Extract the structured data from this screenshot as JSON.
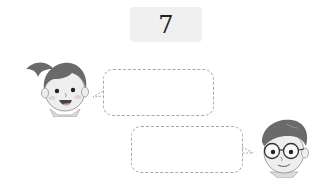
{
  "problem": {
    "number": "7"
  },
  "characters": [
    {
      "name": "girl",
      "icon": "girl-face-icon",
      "position": "left"
    },
    {
      "name": "boy",
      "icon": "boy-with-glasses-icon",
      "position": "right"
    }
  ],
  "speech_bubbles": [
    {
      "speaker": "girl",
      "text": ""
    },
    {
      "speaker": "boy",
      "text": ""
    }
  ],
  "colors": {
    "badge_bg": "#f0f0f0",
    "bubble_border": "#a8a8a8",
    "hair": "#6a6a6a",
    "skin": "#ededed"
  }
}
